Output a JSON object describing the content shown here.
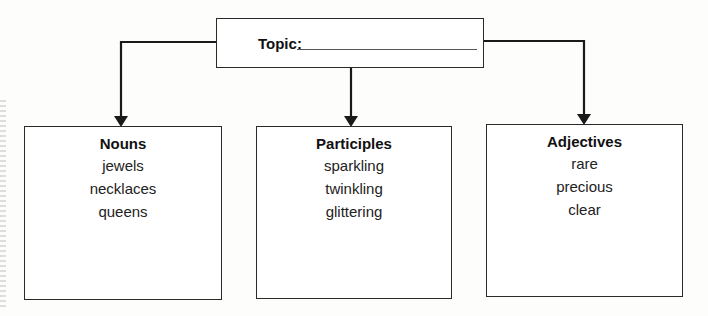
{
  "topic": {
    "label": "Topic:",
    "value": ""
  },
  "categories": [
    {
      "title": "Nouns",
      "items": [
        "jewels",
        "necklaces",
        "queens"
      ]
    },
    {
      "title": "Participles",
      "items": [
        "sparkling",
        "twinkling",
        "glittering"
      ]
    },
    {
      "title": "Adjectives",
      "items": [
        "rare",
        "precious",
        "clear"
      ]
    }
  ]
}
